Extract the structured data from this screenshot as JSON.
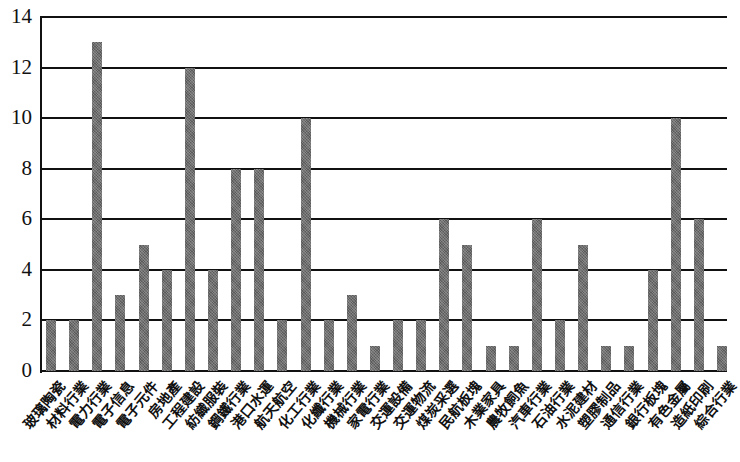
{
  "chart_data": {
    "type": "bar",
    "title": "",
    "xlabel": "",
    "ylabel": "",
    "ylim": [
      0,
      14
    ],
    "yticks": [
      0,
      2,
      4,
      6,
      8,
      10,
      12,
      14
    ],
    "grid": true,
    "legend": null,
    "categories": [
      "玻璃陶瓷",
      "材料行業",
      "電力行業",
      "電子信息",
      "電子元件",
      "房地產",
      "工程建設",
      "紡織服裝",
      "鋼鐵行業",
      "港口水運",
      "航天航空",
      "化工行業",
      "化纖行業",
      "機械行業",
      "家電行業",
      "交運設備",
      "交運物流",
      "煤炭采選",
      "民航板塊",
      "木業家具",
      "農牧飼魚",
      "汽車行業",
      "石油行業",
      "水泥建材",
      "塑膠制品",
      "通信行業",
      "銀行板塊",
      "有色金屬",
      "造紙印刷",
      "綜合行業"
    ],
    "values": [
      2,
      2,
      13,
      3,
      5,
      4,
      12,
      4,
      8,
      8,
      2,
      10,
      2,
      3,
      1,
      2,
      2,
      6,
      5,
      1,
      1,
      6,
      2,
      5,
      1,
      1,
      4,
      10,
      6,
      1
    ]
  },
  "colors": {
    "bar": "#6f6f6f",
    "grid": "#111111",
    "background": "#ffffff"
  }
}
